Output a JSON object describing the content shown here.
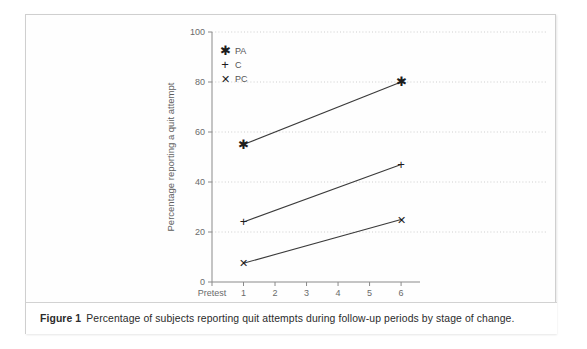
{
  "figure": {
    "caption_label": "Figure 1",
    "caption_text": "Percentage of subjects reporting quit attempts during follow-up periods by stage of change."
  },
  "chart_data": {
    "type": "line",
    "title": "",
    "xlabel": "Months",
    "ylabel": "Percentage reporting a quit attempt",
    "x_ticklabels": [
      "Pretest",
      "1",
      "2",
      "3",
      "4",
      "5",
      "6"
    ],
    "x_tickvalues": [
      0,
      1,
      2,
      3,
      4,
      5,
      6
    ],
    "xlim": [
      0,
      6.6
    ],
    "y_ticklabels": [
      "0",
      "20",
      "40",
      "60",
      "80",
      "100"
    ],
    "y_tickvalues": [
      0,
      20,
      40,
      60,
      80,
      100
    ],
    "ylim": [
      0,
      100
    ],
    "grid": "horizontal-dotted",
    "legend_position": "top-left-inside",
    "series": [
      {
        "name": "PA",
        "marker": "asterisk",
        "marker_glyph": "✱",
        "x": [
          1,
          6
        ],
        "values": [
          55,
          80
        ]
      },
      {
        "name": "C",
        "marker": "plus",
        "marker_glyph": "+",
        "x": [
          1,
          6
        ],
        "values": [
          24,
          47
        ]
      },
      {
        "name": "PC",
        "marker": "cross",
        "marker_glyph": "✕",
        "x": [
          1,
          6
        ],
        "values": [
          7.5,
          25
        ]
      }
    ]
  },
  "colors": {
    "line": "#3a3a3a",
    "marker": "#1d1d1d",
    "axis": "#8a8a8a",
    "gridline": "#c9c9c9",
    "tick_label": "#6a6a6a",
    "frame_border": "#cfcfcf"
  }
}
